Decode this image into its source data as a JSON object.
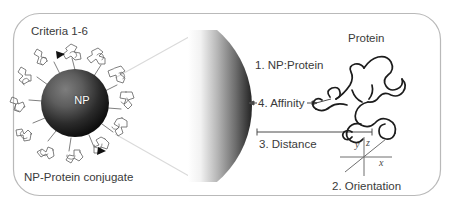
{
  "figure": {
    "title_label": "Criteria 1-6",
    "panel_border_color": "#b9b9b9",
    "background_color": "#ffffff",
    "text_color": "#3a3a3a"
  },
  "conjugate": {
    "caption": "NP-Protein conjugate",
    "core_label": "NP",
    "core_color_center": "#6e6e6e",
    "core_color_edge": "#111111",
    "ligand_stroke_color": "#5a5a5a",
    "marker_count": 2
  },
  "magnified_sphere": {
    "gradient_light": "#ffffff",
    "gradient_dark": "#222222",
    "cone_stroke_color": "#d8d8d8"
  },
  "criteria": [
    {
      "index": "1",
      "label": "1. NP:Protein"
    },
    {
      "index": "4",
      "label": "4. Affinity"
    },
    {
      "index": "3",
      "label": "3. Distance"
    },
    {
      "index": "2",
      "label": "2. Orientation"
    }
  ],
  "callouts": {
    "np_protein": "1. NP:Protein",
    "affinity": "4. Affinity",
    "distance": "3. Distance",
    "orientation": "2. Orientation"
  },
  "protein": {
    "caption": "Protein",
    "stroke_color": "#1c1c1c"
  },
  "axes": {
    "x_label": "x",
    "y_label": "y",
    "z_label": "z",
    "stroke_color": "#6f6f6f"
  }
}
